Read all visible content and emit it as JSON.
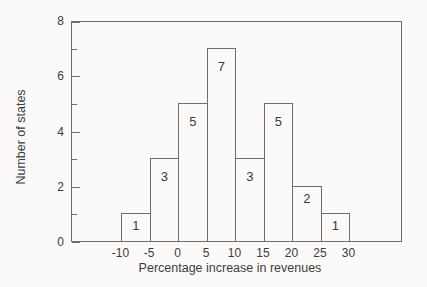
{
  "chart_data": {
    "type": "bar",
    "subtype": "histogram",
    "title": "",
    "xlabel": "Percentage increase in revenues",
    "ylabel": "Number of states",
    "bin_edges": [
      -10,
      -5,
      0,
      5,
      10,
      15,
      20,
      25,
      30
    ],
    "values": [
      1,
      3,
      5,
      7,
      3,
      5,
      2,
      1
    ],
    "bar_value_labels": [
      "1",
      "3",
      "5",
      "7",
      "3",
      "5",
      "2",
      "1"
    ],
    "x_tick_labels": [
      "-10",
      "-5",
      "0",
      "5",
      "10",
      "15",
      "20",
      "25",
      "30"
    ],
    "y_tick_labels": [
      "0",
      "2",
      "4",
      "6",
      "8"
    ],
    "y_major_ticks": [
      0,
      2,
      4,
      6,
      8
    ],
    "y_minor_ticks": [
      1,
      3,
      5,
      7
    ],
    "ylim": [
      0,
      8
    ],
    "grid": false,
    "legend": false,
    "frame": "full-box",
    "tick_direction": "in",
    "colors": {
      "background": "#fbfaf8",
      "line": "#6e6e6e",
      "text": "#3c3c3c",
      "bar_fill": "#fbfaf8"
    }
  }
}
